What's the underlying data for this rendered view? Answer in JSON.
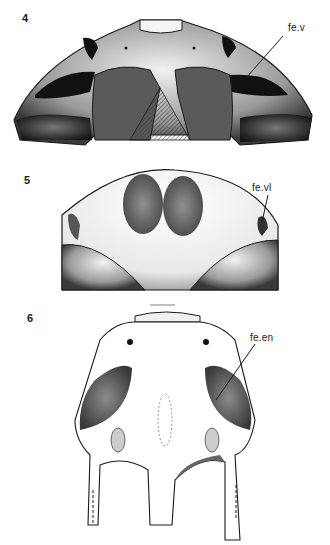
{
  "figures": [
    {
      "number": "4",
      "label": "fe.v"
    },
    {
      "number": "5",
      "label": "fe.vl"
    },
    {
      "number": "6",
      "label": "fe.en"
    }
  ],
  "colors": {
    "ink": "#1a1a1a",
    "paper": "#ffffff",
    "shade": "#555555",
    "light_shade": "#bdbdbd"
  }
}
